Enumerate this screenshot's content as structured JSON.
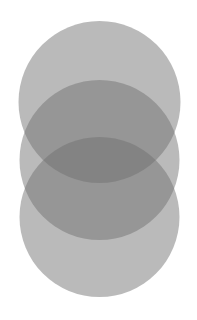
{
  "diagram": {
    "type": "overlapping-circles",
    "background": "#ffffff",
    "circles": [
      {
        "id": "top",
        "cx": 99.5,
        "cy": 102,
        "r": 81,
        "fill": "#6e6e6e",
        "opacity": 0.48
      },
      {
        "id": "middle",
        "cx": 99.5,
        "cy": 160,
        "r": 80,
        "fill": "#6e6e6e",
        "opacity": 0.48
      },
      {
        "id": "bottom",
        "cx": 99.5,
        "cy": 217,
        "r": 80,
        "fill": "#6e6e6e",
        "opacity": 0.48
      }
    ]
  }
}
